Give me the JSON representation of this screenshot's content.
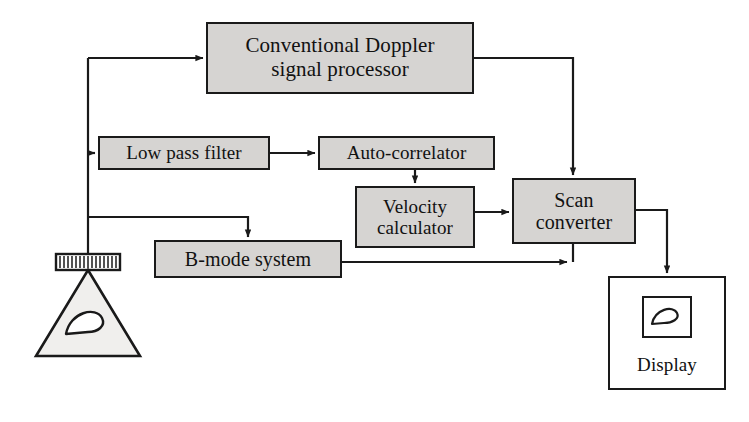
{
  "figure": {
    "background_color": "#ffffff",
    "box_fill": "#d6d4d2",
    "line_color": "#1a1a1a"
  },
  "nodes": {
    "doppler": {
      "label": "Conventional Doppler\nsignal processor"
    },
    "low_pass_filter": {
      "label": "Low pass filter"
    },
    "auto_correlator": {
      "label": "Auto-correlator"
    },
    "velocity_calculator": {
      "label": "Velocity\ncalculator"
    },
    "scan_converter": {
      "label": "Scan\nconverter"
    },
    "b_mode_system": {
      "label": "B-mode system"
    },
    "display": {
      "label": "Display"
    },
    "transducer": {
      "label": ""
    }
  },
  "icons": {
    "transducer_array": "transducer-array-icon",
    "scan_cone": "scan-cone-icon",
    "display_image": "display-image-icon"
  },
  "connections": [
    {
      "id": "transducer-to-doppler",
      "from": "transducer",
      "to": "doppler",
      "arrow": true
    },
    {
      "id": "transducer-to-low-pass-filter",
      "from": "transducer",
      "to": "low_pass_filter",
      "arrow": true
    },
    {
      "id": "transducer-to-b-mode-system",
      "from": "transducer",
      "to": "b_mode_system",
      "arrow": true
    },
    {
      "id": "low-pass-filter-to-auto-correlator",
      "from": "low_pass_filter",
      "to": "auto_correlator",
      "arrow": true
    },
    {
      "id": "auto-correlator-to-velocity",
      "from": "auto_correlator",
      "to": "velocity_calculator",
      "arrow": true
    },
    {
      "id": "velocity-to-scan-converter",
      "from": "velocity_calculator",
      "to": "scan_converter",
      "arrow": true
    },
    {
      "id": "doppler-to-scan-converter",
      "from": "doppler",
      "to": "scan_converter",
      "arrow": true
    },
    {
      "id": "b-mode-system-to-scan-converter",
      "from": "b_mode_system",
      "to": "scan_converter",
      "arrow": true
    },
    {
      "id": "scan-converter-to-display",
      "from": "scan_converter",
      "to": "display",
      "arrow": true
    }
  ]
}
